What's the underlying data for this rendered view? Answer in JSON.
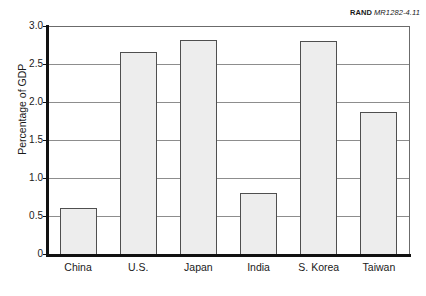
{
  "credit": {
    "mark": "RAND",
    "number": "MR1282-4.11"
  },
  "chart_data": {
    "type": "bar",
    "title": "",
    "xlabel": "",
    "ylabel": "Percentage of GDP",
    "categories": [
      "China",
      "U.S.",
      "Japan",
      "India",
      "S. Korea",
      "Taiwan"
    ],
    "values": [
      0.6,
      2.66,
      2.82,
      0.8,
      2.8,
      1.87
    ],
    "ylim": [
      0,
      3.0
    ],
    "yticks": [
      0,
      0.5,
      1.0,
      1.5,
      2.0,
      2.5,
      3.0
    ],
    "ytick_labels": [
      "0",
      "0.5",
      "1.0",
      "1.5",
      "2.0",
      "2.5",
      "3.0"
    ],
    "grid": true,
    "legend": false,
    "bar_fill_color": "#ededed",
    "bar_edge_color": "#4f4f4f",
    "axis_color": "#111111",
    "gridline_color": "#8d8d8d"
  }
}
